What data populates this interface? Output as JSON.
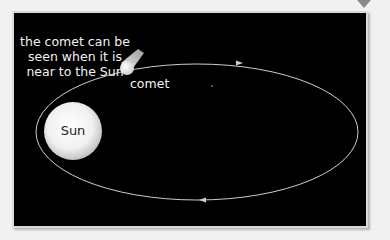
{
  "diagram": {
    "caption_lines": [
      "the comet can be",
      "seen when it is",
      "near to the Sun"
    ],
    "comet_label": "comet",
    "sun_label": "Sun",
    "orbit_direction": "anticlockwise",
    "colors": {
      "background": "#000000",
      "orbit": "#cfcfcf",
      "sun": "#f5f5f5",
      "text": "#f2f2f2",
      "page": "#f1f1f1"
    }
  }
}
